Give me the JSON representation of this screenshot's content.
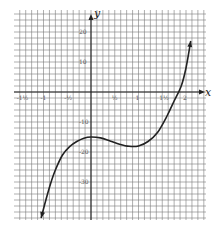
{
  "chart_data": {
    "type": "line",
    "title": "",
    "xlabel": "x",
    "ylabel": "y",
    "xlim": [
      -1.75,
      2.35
    ],
    "ylim": [
      -45,
      28
    ],
    "grid": true,
    "x_ticks": [
      {
        "value": -1.5,
        "label": "-1½"
      },
      {
        "value": -1,
        "label": "-1"
      },
      {
        "value": -0.5,
        "label": "-½"
      },
      {
        "value": 0.5,
        "label": "½"
      },
      {
        "value": 1,
        "label": "1"
      },
      {
        "value": 1.5,
        "label": "1½"
      },
      {
        "value": 2,
        "label": "2"
      }
    ],
    "y_ticks": [
      {
        "value": 20,
        "label": "20"
      },
      {
        "value": 10,
        "label": "10"
      },
      {
        "value": -10,
        "label": "-10"
      },
      {
        "value": -20,
        "label": "-20"
      },
      {
        "value": -30,
        "label": "-30"
      }
    ],
    "series": [
      {
        "name": "curve",
        "x": [
          -1.05,
          -0.95,
          -0.85,
          -0.75,
          -0.6,
          -0.45,
          -0.3,
          -0.15,
          0,
          0.2,
          0.4,
          0.6,
          0.8,
          1.0,
          1.2,
          1.4,
          1.6,
          1.75,
          1.9,
          2.0,
          2.1
        ],
        "y": [
          -42,
          -36,
          -30.5,
          -26,
          -21,
          -18.2,
          -16.5,
          -15.4,
          -15,
          -15.3,
          -16.3,
          -17.4,
          -18.1,
          -18,
          -16.5,
          -13.5,
          -8,
          -3,
          2,
          8,
          17
        ]
      }
    ]
  }
}
